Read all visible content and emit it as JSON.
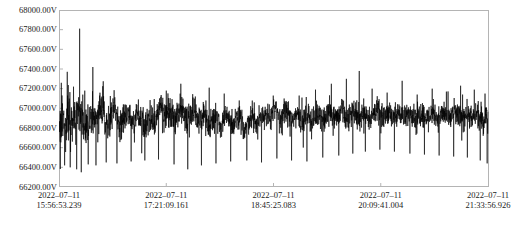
{
  "chart_data": {
    "type": "line",
    "title": "",
    "xlabel": "",
    "ylabel": "",
    "grid": false,
    "legend": null,
    "line_color": "#000000",
    "frame_color": "#b4b4b4",
    "y_unit": "V",
    "ylim": [
      66200,
      68000
    ],
    "y_ticks": [
      66200,
      66400,
      66600,
      66800,
      67000,
      67200,
      67400,
      67600,
      67800,
      68000
    ],
    "y_tick_labels": [
      "66200.00V",
      "66400.00V",
      "66600.00V",
      "66800.00V",
      "67000.00V",
      "67200.00V",
      "67400.00V",
      "67600.00V",
      "67800.00V",
      "68000.00V"
    ],
    "x_tick_labels": [
      {
        "date": "2022–07–11",
        "time": "15:56:53.239"
      },
      {
        "date": "2022–07–11",
        "time": "17:21:09.161"
      },
      {
        "date": "2022–07–11",
        "time": "18:45:25.083"
      },
      {
        "date": "2022–07–11",
        "time": "20:09:41.004"
      },
      {
        "date": "2022–07–11",
        "time": "21:33:56.926"
      }
    ],
    "x_start": "2022-07-11 15:56:53.239",
    "x_end": "2022-07-11 21:33:56.926",
    "series_name": "voltage",
    "baseline": 66850,
    "trend": [
      66840,
      66870,
      66900,
      66890,
      66860,
      66830,
      66820,
      66840,
      66870,
      66900,
      66930,
      66950,
      66940,
      66910,
      66880,
      66860,
      66870,
      66890,
      66910,
      66930,
      66950,
      66960,
      66940,
      66900,
      66860,
      66830,
      66810,
      66800,
      66820,
      66850,
      66880,
      66910,
      66930,
      66940,
      66930,
      66910,
      66890,
      66880,
      66890,
      66910,
      66940,
      66970,
      66990,
      67000,
      66990,
      66960,
      66930,
      66900,
      66880,
      66870,
      66880,
      66900,
      66930,
      66960,
      66980,
      66990,
      66980,
      66960,
      66930,
      66900,
      66870,
      66850,
      66840,
      66850,
      66870,
      66900,
      66930,
      66950,
      66960,
      66950,
      66930,
      66900,
      66870,
      66850,
      66840,
      66850,
      66870,
      66890,
      66910,
      66920,
      66910,
      66890,
      66860,
      66830,
      66810,
      66800,
      66810,
      66830,
      66860,
      66890,
      66910,
      66920,
      66910,
      66890,
      66870,
      66860,
      66870,
      66900,
      66940,
      66980,
      67010,
      67030,
      67030,
      67010,
      66980,
      66950,
      66930,
      66920,
      66930,
      66950,
      66970,
      66980,
      66970,
      66950,
      66920,
      66900,
      66890,
      66900,
      66920,
      66950,
      66980,
      67000,
      67010,
      67000,
      66980,
      66950,
      66920,
      66900,
      66890,
      66900,
      66920,
      66950,
      66970,
      66980,
      66970,
      66950,
      66920,
      66890,
      66870,
      66860,
      66870,
      66890,
      66910,
      66930,
      66940,
      66930,
      66910,
      66880,
      66850,
      66830,
      66820,
      66830,
      66850,
      66880,
      66910,
      66930,
      66940,
      66930,
      66910,
      66880,
      66850,
      66830,
      66820,
      66830,
      66850,
      66880,
      66900,
      66920,
      66930,
      66920,
      66900,
      66870,
      66850,
      66830,
      66820,
      66830,
      66850,
      66870,
      66890,
      66900,
      66890,
      66870,
      66850,
      66830,
      66810,
      66800,
      66800,
      66810,
      66830,
      66860,
      66890,
      66910,
      66920,
      66910,
      66890,
      66870,
      66850,
      66840,
      66840,
      66860,
      66880,
      66910,
      66930,
      66950,
      66950,
      66940,
      66920,
      66900,
      66880,
      66870,
      66880,
      66900,
      66930,
      66960,
      66980,
      66990,
      66990,
      66970,
      66950,
      66920,
      66900,
      66890,
      66890,
      66910,
      66930,
      66960,
      66980,
      66990,
      66980,
      66960,
      66930,
      66900,
      66880,
      66870,
      66880,
      66900,
      66920,
      66940,
      66950,
      66940,
      66920,
      66900,
      66880,
      66860,
      66860,
      66870,
      66890,
      66910,
      66930,
      66940,
      66930,
      66910,
      66890,
      66870,
      66860,
      66860,
      66880,
      66900,
      66930,
      66950,
      66960,
      66950,
      66930,
      66910,
      66890,
      66880,
      66880,
      66900,
      66920,
      66950,
      66970,
      66980,
      66970,
      66950,
      66930,
      66910,
      66890,
      66890,
      66900,
      66920,
      66950,
      66970,
      66980,
      66980,
      66960,
      66940,
      66910,
      66890,
      66880,
      66880,
      66900,
      66920,
      66950,
      66970,
      66980,
      66970,
      66960,
      66940,
      66920,
      66900,
      66890,
      66900,
      66920,
      66940,
      66960,
      66970,
      66970,
      66960,
      66940,
      66920,
      66900,
      66890,
      66890,
      66900,
      66920,
      66950,
      66970,
      66980,
      66980,
      66970,
      66950,
      66930,
      66910,
      66900,
      66900,
      66910,
      66930,
      66950,
      66970,
      66980,
      66980,
      66970,
      66950,
      66930,
      66910,
      66900,
      66900,
      66910,
      66930,
      66950,
      66960,
      66970,
      66960,
      66950,
      66930,
      66910,
      66900,
      66900,
      66910,
      66930,
      66950,
      66960,
      66970,
      66960,
      66950,
      66930,
      66910,
      66900,
      66900,
      66910,
      66930,
      66950,
      66960,
      66960,
      66950,
      66940,
      66920,
      66910,
      66900,
      66900,
      66910,
      66930,
      66950,
      66960,
      66960,
      66950,
      66940,
      66920,
      66910,
      66900,
      66900,
      66910,
      66930,
      66940,
      66950,
      66950,
      66940,
      66930,
      66910,
      66900,
      66890,
      66890,
      66900,
      66920,
      66940,
      66950,
      66950,
      66940,
      66930,
      66910,
      66900,
      66890,
      66890,
      66900,
      66920,
      66940,
      66950,
      66950,
      66940,
      66930,
      66910,
      66900,
      66890,
      66890,
      66900,
      66920,
      66930,
      66940,
      66940,
      66930,
      66920,
      66900,
      66890,
      66880,
      66880,
      66890,
      66910,
      66930,
      66940,
      66940
    ],
    "noise_amplitude": 120,
    "spikes": [
      {
        "x": 0.008,
        "y": 67050
      },
      {
        "x": 0.013,
        "y": 66420
      },
      {
        "x": 0.02,
        "y": 67130
      },
      {
        "x": 0.026,
        "y": 66400
      },
      {
        "x": 0.034,
        "y": 67220
      },
      {
        "x": 0.041,
        "y": 66380
      },
      {
        "x": 0.048,
        "y": 67810
      },
      {
        "x": 0.052,
        "y": 66350
      },
      {
        "x": 0.06,
        "y": 67180
      },
      {
        "x": 0.068,
        "y": 66430
      },
      {
        "x": 0.079,
        "y": 67420
      },
      {
        "x": 0.086,
        "y": 66420
      },
      {
        "x": 0.098,
        "y": 67100
      },
      {
        "x": 0.11,
        "y": 66450
      },
      {
        "x": 0.122,
        "y": 67060
      },
      {
        "x": 0.135,
        "y": 66440
      },
      {
        "x": 0.15,
        "y": 67040
      },
      {
        "x": 0.168,
        "y": 66460
      },
      {
        "x": 0.185,
        "y": 67090
      },
      {
        "x": 0.2,
        "y": 66470
      },
      {
        "x": 0.215,
        "y": 67030
      },
      {
        "x": 0.232,
        "y": 66480
      },
      {
        "x": 0.25,
        "y": 67180
      },
      {
        "x": 0.268,
        "y": 66430
      },
      {
        "x": 0.284,
        "y": 67250
      },
      {
        "x": 0.3,
        "y": 66380
      },
      {
        "x": 0.318,
        "y": 67120
      },
      {
        "x": 0.332,
        "y": 66420
      },
      {
        "x": 0.35,
        "y": 67210
      },
      {
        "x": 0.366,
        "y": 66440
      },
      {
        "x": 0.385,
        "y": 67150
      },
      {
        "x": 0.4,
        "y": 66460
      },
      {
        "x": 0.42,
        "y": 67080
      },
      {
        "x": 0.438,
        "y": 66470
      },
      {
        "x": 0.455,
        "y": 67060
      },
      {
        "x": 0.472,
        "y": 66450
      },
      {
        "x": 0.49,
        "y": 67040
      },
      {
        "x": 0.508,
        "y": 66490
      },
      {
        "x": 0.525,
        "y": 67100
      },
      {
        "x": 0.542,
        "y": 66470
      },
      {
        "x": 0.56,
        "y": 67130
      },
      {
        "x": 0.578,
        "y": 66460
      },
      {
        "x": 0.598,
        "y": 67190
      },
      {
        "x": 0.615,
        "y": 66500
      },
      {
        "x": 0.635,
        "y": 67250
      },
      {
        "x": 0.652,
        "y": 66520
      },
      {
        "x": 0.67,
        "y": 67300
      },
      {
        "x": 0.685,
        "y": 66540
      },
      {
        "x": 0.7,
        "y": 67380
      },
      {
        "x": 0.714,
        "y": 66560
      },
      {
        "x": 0.73,
        "y": 67200
      },
      {
        "x": 0.748,
        "y": 66580
      },
      {
        "x": 0.765,
        "y": 67160
      },
      {
        "x": 0.782,
        "y": 66560
      },
      {
        "x": 0.8,
        "y": 67280
      },
      {
        "x": 0.818,
        "y": 66540
      },
      {
        "x": 0.835,
        "y": 67140
      },
      {
        "x": 0.852,
        "y": 66530
      },
      {
        "x": 0.87,
        "y": 67200
      },
      {
        "x": 0.886,
        "y": 66520
      },
      {
        "x": 0.903,
        "y": 67170
      },
      {
        "x": 0.92,
        "y": 66510
      },
      {
        "x": 0.936,
        "y": 67230
      },
      {
        "x": 0.952,
        "y": 66500
      },
      {
        "x": 0.968,
        "y": 67190
      },
      {
        "x": 0.982,
        "y": 66470
      },
      {
        "x": 0.993,
        "y": 67150
      },
      {
        "x": 0.998,
        "y": 66440
      }
    ]
  }
}
